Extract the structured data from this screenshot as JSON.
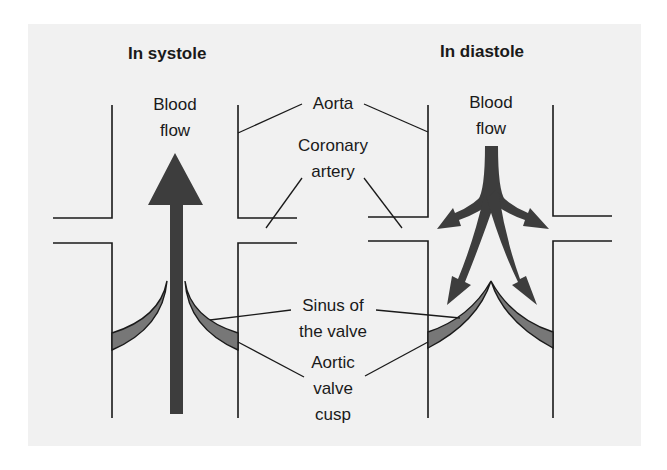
{
  "titles": {
    "systole": "In systole",
    "diastole": "In diastole"
  },
  "labels": {
    "blood_flow_systole": [
      "Blood",
      "flow"
    ],
    "blood_flow_diastole": [
      "Blood",
      "flow"
    ],
    "aorta": "Aorta",
    "coronary_artery": [
      "Coronary",
      "artery"
    ],
    "sinus_of_valve": [
      "Sinus of",
      "the valve"
    ],
    "aortic_valve_cusp": [
      "Aortic",
      "valve",
      "cusp"
    ]
  },
  "colors": {
    "background": "#f1f1f1",
    "arrow": "#3d3d3d",
    "cusp_fill": "#777777",
    "line": "#1a1a1a"
  }
}
